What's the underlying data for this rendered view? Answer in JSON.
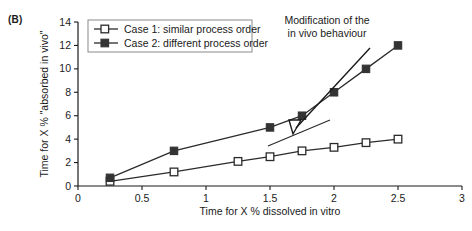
{
  "panel": {
    "label": "(B)"
  },
  "chart_data": {
    "type": "line",
    "title": "",
    "xlabel": "Time for X % dissolved in vitro",
    "ylabel": "Time for X % \"absorbed in vivo\"",
    "xlim": [
      0,
      3
    ],
    "ylim": [
      0,
      14
    ],
    "xticks": [
      0,
      0.5,
      1,
      1.5,
      2,
      2.5,
      3
    ],
    "xticklabels": [
      "0",
      "0.5",
      "1",
      "1.5",
      "2",
      "2.5",
      "3"
    ],
    "yticks": [
      0,
      2,
      4,
      6,
      8,
      10,
      12,
      14
    ],
    "yticklabels": [
      "0",
      "2",
      "4",
      "6",
      "8",
      "10",
      "12",
      "14"
    ],
    "grid": false,
    "legend_position": "top-left",
    "series": [
      {
        "name": "Case 1: similar process order",
        "marker": "open-square",
        "color": "#2b2b2b",
        "points": [
          {
            "x": 0.25,
            "y": 0.4
          },
          {
            "x": 0.75,
            "y": 1.2
          },
          {
            "x": 1.25,
            "y": 2.1
          },
          {
            "x": 1.5,
            "y": 2.5
          },
          {
            "x": 1.75,
            "y": 3.0
          },
          {
            "x": 2.0,
            "y": 3.3
          },
          {
            "x": 2.25,
            "y": 3.7
          },
          {
            "x": 2.5,
            "y": 4.0
          }
        ]
      },
      {
        "name": "Case 2: different process order",
        "marker": "filled-square",
        "color": "#333333",
        "points": [
          {
            "x": 0.25,
            "y": 0.7
          },
          {
            "x": 0.75,
            "y": 3.0
          },
          {
            "x": 1.5,
            "y": 5.0
          },
          {
            "x": 1.75,
            "y": 6.0
          },
          {
            "x": 2.0,
            "y": 8.0
          },
          {
            "x": 2.25,
            "y": 10.0
          },
          {
            "x": 2.5,
            "y": 12.0
          }
        ]
      }
    ],
    "annotations": [
      {
        "text_line1": "Modification of the",
        "text_line2": "in vivo behaviour",
        "target": {
          "x": 1.75,
          "y": 6.0
        }
      }
    ]
  },
  "legend": {
    "entries": [
      {
        "label": "Case 1: similar process order",
        "marker": "open-square"
      },
      {
        "label": "Case 2: different process order",
        "marker": "filled-square"
      }
    ]
  }
}
